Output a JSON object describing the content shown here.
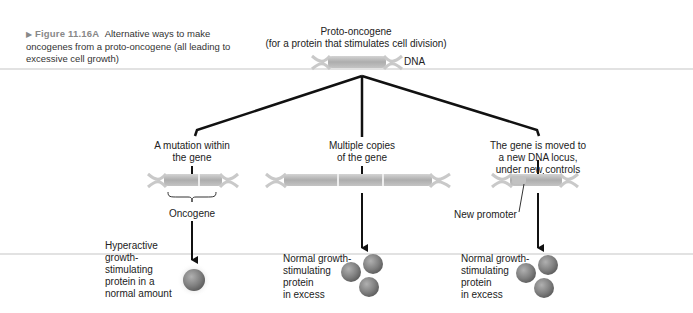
{
  "caption": {
    "figure_label": "Figure 11.16A",
    "text": "Alternative ways to make oncogenes from a proto-oncogene (all leading to excessive cell growth)"
  },
  "top": {
    "title_line1": "Proto-oncogene",
    "title_line2": "(for a protein that stimulates cell division)",
    "dna_label": "DNA"
  },
  "branches": [
    {
      "heading_line1": "A mutation within",
      "heading_line2": "the gene",
      "annotation": "Oncogene",
      "result_lines": [
        "Hyperactive",
        "growth-",
        "stimulating",
        "protein in a",
        "normal amount"
      ]
    },
    {
      "heading_line1": "Multiple copies",
      "heading_line2": "of the gene",
      "result_lines": [
        "Normal growth-",
        "stimulating",
        "protein",
        "in excess"
      ]
    },
    {
      "heading_line1": "The gene is moved to",
      "heading_line2": "a new DNA locus,",
      "heading_line3": "under new controls",
      "annotation": "New promoter",
      "result_lines": [
        "Normal growth-",
        "stimulating",
        "protein",
        "in excess"
      ]
    }
  ],
  "colors": {
    "gene": "#b3b3b3",
    "helix": "#c9c9c9",
    "protein": "#7a7a7a",
    "arrow": "#111111",
    "separator": "#e2e2e2"
  }
}
